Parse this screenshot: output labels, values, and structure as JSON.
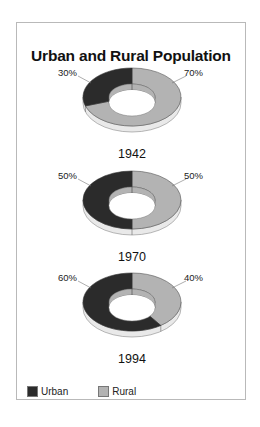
{
  "chart_data": {
    "type": "pie",
    "subtype": "3d-donut",
    "title": "Urban and Rural Population",
    "series_names": [
      "Urban",
      "Rural"
    ],
    "colors": {
      "Urban": "#2b2b2b",
      "Rural": "#b3b3b3",
      "edge": "#e9e9e9"
    },
    "charts": [
      {
        "label": "1942",
        "values": {
          "Urban": 30,
          "Rural": 70
        },
        "labels": {
          "Urban": "30%",
          "Rural": "70%"
        }
      },
      {
        "label": "1970",
        "values": {
          "Urban": 50,
          "Rural": 50
        },
        "labels": {
          "Urban": "50%",
          "Rural": "50%"
        }
      },
      {
        "label": "1994",
        "values": {
          "Urban": 60,
          "Rural": 40
        },
        "labels": {
          "Urban": "60%",
          "Rural": "40%"
        }
      }
    ],
    "legend": {
      "position": "bottom-left",
      "entries": [
        "Urban",
        "Rural"
      ]
    }
  },
  "title": "Urban and Rural Population",
  "donuts": [
    {
      "year": "1942",
      "urban_label": "30%",
      "rural_label": "70%"
    },
    {
      "year": "1970",
      "urban_label": "50%",
      "rural_label": "50%"
    },
    {
      "year": "1994",
      "urban_label": "60%",
      "rural_label": "40%"
    }
  ],
  "legend": {
    "items": [
      {
        "label": "Urban",
        "color": "#2b2b2b"
      },
      {
        "label": "Rural",
        "color": "#b3b3b3"
      }
    ]
  }
}
